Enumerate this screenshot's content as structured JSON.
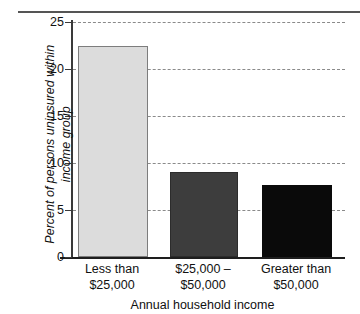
{
  "chart_data": {
    "type": "bar",
    "title": "",
    "subtitle": "",
    "xlabel": "Annual household income",
    "ylabel": "Percent of persons uninsured within\nincome group",
    "categories": [
      "Less than\n$25,000",
      "$25,000 –\n$50,000",
      "Greater than\n$50,000"
    ],
    "values": [
      22.2,
      8.8,
      7.4
    ],
    "ylim": [
      0,
      25
    ],
    "yticks": [
      0,
      5,
      10,
      15,
      20,
      25
    ],
    "ytick_labels": [
      "0",
      "5",
      "10",
      "15",
      "20",
      "25"
    ],
    "grid": "horizontal-dashed",
    "legend": "none",
    "bar_colors": [
      "#dcdcdc",
      "#3d3d3d",
      "#0a0a0a"
    ],
    "bar_edge_colors": [
      "#7d7d7d",
      "#2c2c2c",
      "#0a0a0a"
    ],
    "axis_color": "#1e1e1e",
    "gridline_color": "#8a8a8a",
    "text_color": "#111111",
    "background": "#ffffff"
  }
}
